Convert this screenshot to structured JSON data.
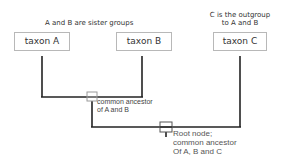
{
  "header_labels": {
    "sister": "A and B are sister groups",
    "outgroup_line1": "C is the outgroup",
    "outgroup_line2": "to A and B"
  },
  "taxa": [
    {
      "id": "A",
      "label": "taxon A"
    },
    {
      "id": "B",
      "label": "taxon B"
    },
    {
      "id": "C",
      "label": "taxon C"
    }
  ],
  "nodes": {
    "ab_ancestor": {
      "line1": "common ancestor",
      "line2": "of A and B"
    },
    "root": {
      "line1": "Root node;",
      "line2": "common ancestor",
      "line3": "Of A, B and C"
    }
  },
  "colors": {
    "branch": "#222222",
    "box_border": "#b8b8b8",
    "node_marker": "#999999"
  }
}
